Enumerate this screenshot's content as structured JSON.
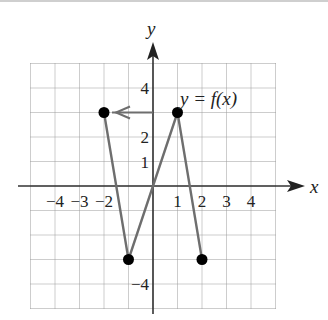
{
  "chart_data": {
    "type": "line",
    "title": "",
    "xlabel": "x",
    "ylabel": "y",
    "xlim": [
      -5,
      5
    ],
    "ylim": [
      -5,
      5
    ],
    "grid": true,
    "x_tick_labels": [
      "-4",
      "-3",
      "-2",
      "1",
      "2",
      "3",
      "4"
    ],
    "x_tick_values": [
      -4,
      -3,
      -2,
      1,
      2,
      3,
      4
    ],
    "y_tick_labels": [
      "4",
      "2",
      "1",
      "-4"
    ],
    "y_tick_values": [
      4,
      2,
      1,
      -4
    ],
    "series": [
      {
        "name": "y = f(x)",
        "x": [
          -2,
          -1,
          0,
          1,
          2
        ],
        "y": [
          3,
          -3,
          0,
          3,
          -3
        ],
        "endpoints_marked": [
          [
            -2,
            3
          ],
          [
            -1,
            -3
          ],
          [
            1,
            3
          ],
          [
            2,
            -3
          ]
        ]
      }
    ],
    "annotations": [
      {
        "text": "y = f(x)",
        "x": 1.2,
        "y": 4
      },
      {
        "type": "arrow",
        "from": [
          0,
          3
        ],
        "to": [
          -2,
          3
        ],
        "description": "horizontal arrow from y-axis at y=3 pointing left to point (-2, 3)"
      }
    ]
  },
  "labels": {
    "x_axis": "x",
    "y_axis": "y",
    "function_label": "y = f(x)",
    "xticks": [
      "−4",
      "−3",
      "−2",
      "1",
      "2",
      "3",
      "4"
    ],
    "yticks": [
      "4",
      "2",
      "1",
      "−4"
    ]
  },
  "colors": {
    "axis": "#333333",
    "grid": "#9a9a9a",
    "curve": "#6e6e6e",
    "points": "#000000",
    "arrow": "#6e6e6e"
  }
}
